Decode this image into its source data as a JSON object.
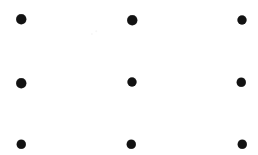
{
  "figure": {
    "width": 258,
    "height": 155,
    "background_color": "#ffffff",
    "dot_color": "#121212"
  },
  "chart_data": {
    "type": "scatter",
    "title": "",
    "subtitle": "",
    "xlabel": "",
    "ylabel": "",
    "grid": false,
    "legend": null,
    "axis_visible": false,
    "tick_labels_x": [],
    "tick_labels_y": [],
    "xlim": [
      0,
      258
    ],
    "ylim": [
      0,
      155
    ],
    "marker": "filled-circle",
    "marker_color": "#121212",
    "rows": 3,
    "columns": 3,
    "column_x": [
      21,
      132,
      241
    ],
    "row_y": [
      19,
      83,
      144
    ],
    "points": [
      {
        "id": "r1c1",
        "x": 21,
        "y": 19,
        "d": 9.5
      },
      {
        "id": "r1c2",
        "x": 132,
        "y": 20,
        "d": 9.5
      },
      {
        "id": "r1c3",
        "x": 242,
        "y": 20,
        "d": 9.0
      },
      {
        "id": "r2c1",
        "x": 21,
        "y": 83,
        "d": 9.5
      },
      {
        "id": "r2c2",
        "x": 132,
        "y": 82,
        "d": 9.0
      },
      {
        "id": "r2c3",
        "x": 241,
        "y": 82,
        "d": 8.5
      },
      {
        "id": "r3c1",
        "x": 21,
        "y": 144,
        "d": 8.5
      },
      {
        "id": "r3c2",
        "x": 131,
        "y": 144,
        "d": 8.5
      },
      {
        "id": "r3c3",
        "x": 242,
        "y": 144,
        "d": 8.5
      }
    ],
    "speckles": [
      {
        "x": 92,
        "y": 34,
        "d": 2.2
      },
      {
        "x": 96,
        "y": 31,
        "d": 1.6
      }
    ]
  }
}
